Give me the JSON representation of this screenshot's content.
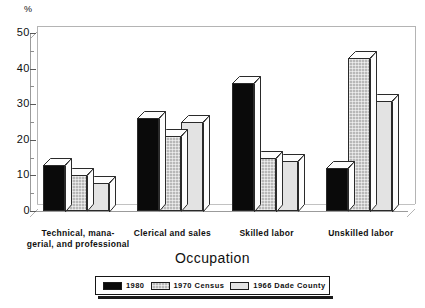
{
  "chart_data": {
    "type": "bar",
    "title": "",
    "xlabel": "Occupation",
    "ylabel": "%",
    "ylim": [
      0,
      50
    ],
    "yticks": [
      0,
      10,
      20,
      30,
      40,
      50
    ],
    "yminor_step": 5,
    "grid": false,
    "legend_position": "bottom",
    "style": "3d-grouped-bars",
    "categories": [
      "Technical, mana-\ngerial, and professional",
      "Clerical and sales",
      "Skilled labor",
      "Unskilled labor"
    ],
    "category_lines": [
      [
        "Technical, mana-",
        "gerial, and professional"
      ],
      [
        "Clerical and sales"
      ],
      [
        "Skilled labor"
      ],
      [
        "Unskilled labor"
      ]
    ],
    "series": [
      {
        "name": "1980",
        "color": "#0a0a0a",
        "values": [
          13,
          26,
          36,
          12
        ]
      },
      {
        "name": "1970 Census",
        "color": "#b8b8b8",
        "values": [
          10,
          21,
          15,
          43
        ]
      },
      {
        "name": "1966 Dade County",
        "color": "#e3e3e3",
        "values": [
          8,
          25,
          14,
          31
        ]
      }
    ]
  },
  "axes": {
    "y_unit_label": "%",
    "y_tick_labels": [
      "50",
      "40",
      "30",
      "20",
      "10",
      "0"
    ],
    "x_axis_title": "Occupation"
  },
  "legend": {
    "items": [
      {
        "label": "1980",
        "swatch": "black-solid"
      },
      {
        "label": "1970 Census",
        "swatch": "gray-hatched"
      },
      {
        "label": "1966 Dade County",
        "swatch": "light-gray"
      }
    ]
  }
}
